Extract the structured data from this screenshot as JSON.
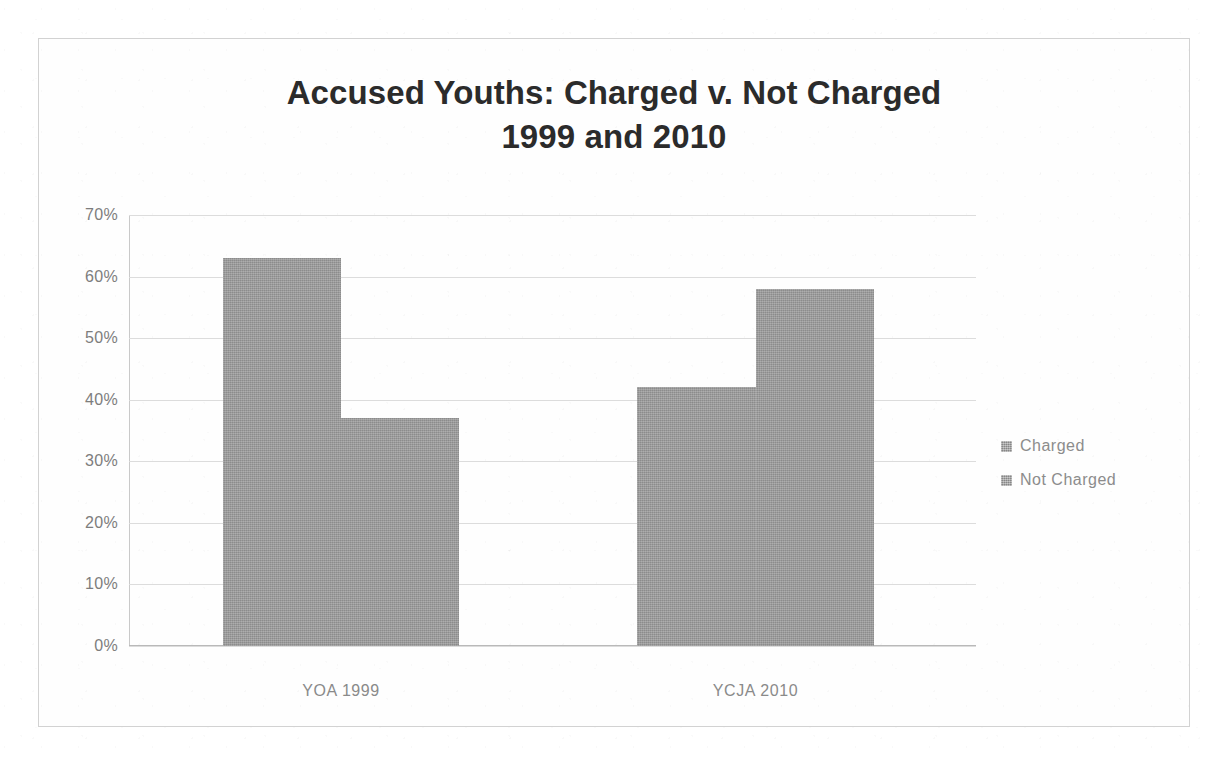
{
  "chart_data": {
    "type": "bar",
    "title": "Accused Youths: Charged v. Not Charged 1999 and 2010",
    "title_line1": "Accused Youths: Charged v. Not Charged",
    "title_line2": "1999 and 2010",
    "xlabel": "",
    "ylabel": "",
    "categories": [
      "YOA 1999",
      "YCJA 2010"
    ],
    "series": [
      {
        "name": "Charged",
        "values": [
          63,
          42
        ],
        "color": "#9a9a9a"
      },
      {
        "name": "Not Charged",
        "values": [
          37,
          58
        ],
        "color": "#9a9a9a"
      }
    ],
    "ylim": [
      0,
      70
    ],
    "ytick_values": [
      70,
      60,
      50,
      40,
      30,
      20,
      10,
      0
    ],
    "ytick_labels": [
      "70%",
      "60%",
      "50%",
      "40%",
      "30%",
      "20%",
      "10%",
      "0%"
    ],
    "grid": true,
    "grid_axis": "y",
    "legend_position": "right",
    "value_format": "percent"
  },
  "legend": {
    "items": [
      {
        "label": "Charged",
        "swatch": "legend-swatch-icon"
      },
      {
        "label": "Not Charged",
        "swatch": "legend-swatch-icon"
      }
    ]
  }
}
